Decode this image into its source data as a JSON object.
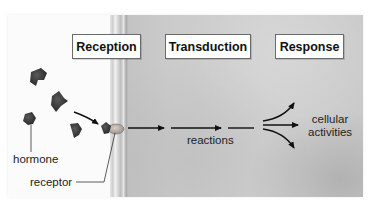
{
  "diagram": {
    "type": "cell signaling pathway",
    "stages": [
      {
        "id": "reception",
        "label": "Reception"
      },
      {
        "id": "transduction",
        "label": "Transduction"
      },
      {
        "id": "response",
        "label": "Response"
      }
    ],
    "labels": {
      "hormone": "hormone",
      "receptor": "receptor",
      "reactions": "reactions",
      "cellular_activities_line1": "cellular",
      "cellular_activities_line2": "activities"
    },
    "flow": [
      {
        "from": "hormone",
        "to": "receptor"
      },
      {
        "from": "receptor",
        "to": "reactions"
      },
      {
        "from": "reactions",
        "to": "cellular activities"
      }
    ],
    "colors": {
      "extracellular": "#fbfbfb",
      "cytoplasm": "#cbcbcb",
      "hormone": "#3a3a3a",
      "arrow": "#111111",
      "box_border": "#6b6b6b"
    }
  }
}
